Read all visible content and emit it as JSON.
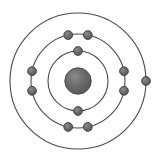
{
  "diagram": {
    "element_symbol": "Na",
    "element_name": "Sodium",
    "atomic_number": 11,
    "electron_configuration": "2-8-1",
    "background_color": "#ffffff",
    "ring_stroke_color": "#4a4a4a",
    "ring_stroke_width": 1.1,
    "electron_fill_color": "#6a6a6a",
    "electron_stroke_color": "#3d3d3d",
    "electron_radius": 4.4,
    "nucleus": {
      "label": "nucleus",
      "cx": 78,
      "cy": 81,
      "r": 13.2,
      "fill_color": "#606060",
      "highlight_color": "#7e7e7e",
      "stroke_color": "#454545"
    },
    "center": {
      "x": 78,
      "y": 81
    },
    "shells": [
      {
        "name": "shell-k",
        "label": "K",
        "index": 1,
        "radius": 30,
        "electron_count": 2,
        "electron_angles_deg": [
          270,
          90
        ]
      },
      {
        "name": "shell-l",
        "label": "L",
        "index": 2,
        "radius": 47,
        "electron_count": 8,
        "electron_angles_deg": [
          258,
          282,
          348,
          12,
          78,
          102,
          168,
          192
        ]
      },
      {
        "name": "shell-m",
        "label": "M",
        "index": 3,
        "radius": 68,
        "electron_count": 1,
        "electron_angles_deg": [
          0
        ]
      }
    ]
  }
}
